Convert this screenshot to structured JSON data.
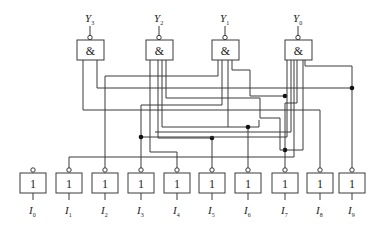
{
  "diagram": {
    "type": "logic-circuit",
    "outputs": [
      {
        "name": "Y",
        "sub": "3",
        "gate_symbol": "&",
        "inputs": [
          "I8",
          "I9"
        ]
      },
      {
        "name": "Y",
        "sub": "2",
        "gate_symbol": "&",
        "inputs": [
          "I4",
          "I5",
          "I6",
          "I7"
        ]
      },
      {
        "name": "Y",
        "sub": "1",
        "gate_symbol": "&",
        "inputs": [
          "I2",
          "I3",
          "I6",
          "I7"
        ]
      },
      {
        "name": "Y",
        "sub": "0",
        "gate_symbol": "&",
        "inputs": [
          "I1",
          "I3",
          "I5",
          "I7",
          "I9"
        ]
      }
    ],
    "inputs": [
      {
        "name": "I",
        "sub": "0",
        "gate_symbol": "1"
      },
      {
        "name": "I",
        "sub": "1",
        "gate_symbol": "1"
      },
      {
        "name": "I",
        "sub": "2",
        "gate_symbol": "1"
      },
      {
        "name": "I",
        "sub": "3",
        "gate_symbol": "1"
      },
      {
        "name": "I",
        "sub": "4",
        "gate_symbol": "1"
      },
      {
        "name": "I",
        "sub": "5",
        "gate_symbol": "1"
      },
      {
        "name": "I",
        "sub": "6",
        "gate_symbol": "1"
      },
      {
        "name": "I",
        "sub": "7",
        "gate_symbol": "1"
      },
      {
        "name": "I",
        "sub": "8",
        "gate_symbol": "1"
      },
      {
        "name": "I",
        "sub": "9",
        "gate_symbol": "1"
      }
    ],
    "colors": {
      "line": "#3a3a3a",
      "junction": "#111111",
      "background": "#ffffff"
    }
  }
}
